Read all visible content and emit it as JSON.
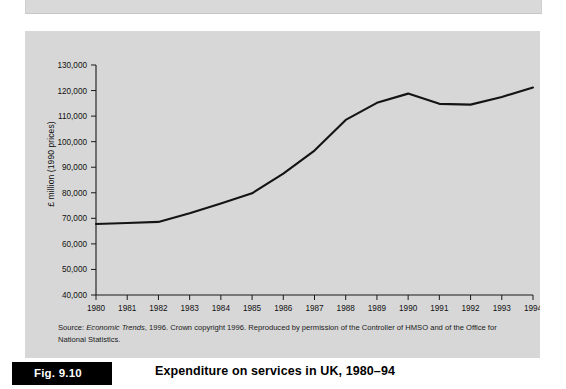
{
  "figure": {
    "tag": "Fig. 9.10",
    "title": "Expenditure on services in UK, 1980–94",
    "source_line1_prefix": "Source: ",
    "source_line1_italic": "Economic Trends",
    "source_line1_rest": ", 1996. Crown copyright 1996. Reproduced by permission of the Controller of",
    "source_line2": "HMSO and of the Office for National Statistics."
  },
  "chart_data": {
    "type": "line",
    "title": "Expenditure on services in UK, 1980–94",
    "xlabel": "",
    "ylabel": "£ million (1990 prices)",
    "x": [
      1980,
      1981,
      1982,
      1983,
      1984,
      1985,
      1986,
      1987,
      1988,
      1989,
      1990,
      1991,
      1992,
      1993,
      1994
    ],
    "categories": [
      "1980",
      "1981",
      "1982",
      "1983",
      "1984",
      "1985",
      "1986",
      "1987",
      "1988",
      "1989",
      "1990",
      "1991",
      "1992",
      "1993",
      "1994"
    ],
    "values": [
      67800,
      68200,
      68600,
      72000,
      75800,
      79800,
      87500,
      96500,
      108500,
      115200,
      118800,
      114800,
      114500,
      117500,
      121200
    ],
    "ytick_labels": [
      "130,000",
      "120,000",
      "110,000",
      "100,000",
      "90,000",
      "80,000",
      "70,000",
      "60,000",
      "50,000",
      "40,000"
    ],
    "yticks": [
      130000,
      120000,
      110000,
      100000,
      90000,
      80000,
      70000,
      60000,
      50000,
      40000
    ],
    "ylim": [
      40000,
      130000
    ],
    "xlim": [
      1980,
      1994
    ],
    "grid": false,
    "legend": false,
    "series": [
      {
        "name": "Expenditure on services",
        "values": [
          67800,
          68200,
          68600,
          72000,
          75800,
          79800,
          87500,
          96500,
          108500,
          115200,
          118800,
          114800,
          114500,
          117500,
          121200
        ]
      }
    ]
  },
  "colors": {
    "panel_background": "#d7d7d7",
    "line": "#141414",
    "axis": "#1a1a1a",
    "caption_tag_background": "#000000",
    "caption_tag_text": "#ffffff"
  }
}
